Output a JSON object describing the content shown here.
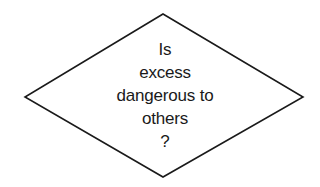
{
  "diagram": {
    "shape": "decision-diamond",
    "stroke_color": "#1a1a1a",
    "fill_color": "#ffffff",
    "text_lines": [
      "Is",
      "excess",
      "dangerous to",
      "others",
      "?"
    ]
  }
}
